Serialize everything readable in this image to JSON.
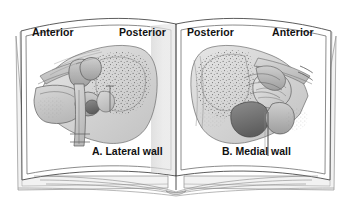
{
  "figure": {
    "background_color": "#ffffff",
    "ink_color": "#111111",
    "line_color": "#555555",
    "page_shadow_color": "#c9c9c9"
  },
  "book": {
    "left_page": {
      "orientation_labels": {
        "left": "Anterior",
        "right": "Posterior"
      },
      "caption": "A. Lateral wall",
      "illustration_name": "lateral-wall-of-tympanic-cavity"
    },
    "right_page": {
      "orientation_labels": {
        "left": "Posterior",
        "right": "Anterior"
      },
      "caption": "B. Medial wall",
      "illustration_name": "medial-wall-of-tympanic-cavity"
    }
  }
}
